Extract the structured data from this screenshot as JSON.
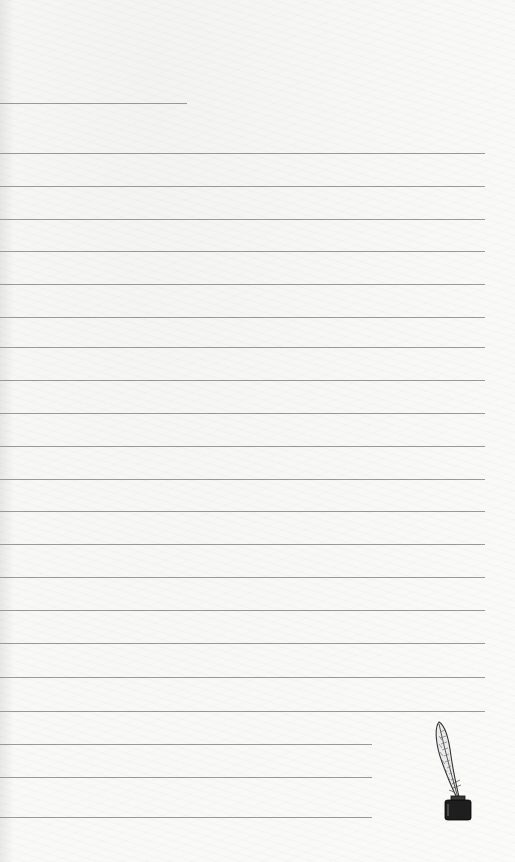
{
  "page": {
    "type": "lined-writing-paper",
    "background_color": "#f8f8f6",
    "line_color": "#9a9a9a"
  },
  "lines": [
    {
      "y": 103,
      "width": 187,
      "kind": "title-line"
    },
    {
      "y": 153,
      "width": 485,
      "kind": "full"
    },
    {
      "y": 186,
      "width": 485,
      "kind": "full"
    },
    {
      "y": 219,
      "width": 485,
      "kind": "full"
    },
    {
      "y": 251,
      "width": 485,
      "kind": "full"
    },
    {
      "y": 284,
      "width": 485,
      "kind": "full"
    },
    {
      "y": 317,
      "width": 485,
      "kind": "full"
    },
    {
      "y": 347,
      "width": 485,
      "kind": "full"
    },
    {
      "y": 380,
      "width": 485,
      "kind": "full"
    },
    {
      "y": 413,
      "width": 485,
      "kind": "full"
    },
    {
      "y": 446,
      "width": 485,
      "kind": "full"
    },
    {
      "y": 479,
      "width": 485,
      "kind": "full"
    },
    {
      "y": 511,
      "width": 485,
      "kind": "full"
    },
    {
      "y": 544,
      "width": 485,
      "kind": "full"
    },
    {
      "y": 577,
      "width": 485,
      "kind": "full"
    },
    {
      "y": 610,
      "width": 485,
      "kind": "full"
    },
    {
      "y": 643,
      "width": 485,
      "kind": "full"
    },
    {
      "y": 677,
      "width": 485,
      "kind": "full"
    },
    {
      "y": 711,
      "width": 485,
      "kind": "full"
    },
    {
      "y": 744,
      "width": 372,
      "kind": "short"
    },
    {
      "y": 777,
      "width": 372,
      "kind": "short"
    },
    {
      "y": 817,
      "width": 372,
      "kind": "short"
    }
  ],
  "decoration": {
    "icon": "quill-inkwell-icon",
    "ink_color": "#1e1e1e"
  }
}
